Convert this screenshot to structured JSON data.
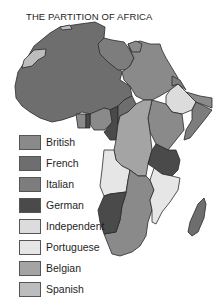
{
  "title": "THE PARTITION OF AFRICA",
  "legend": {
    "items": [
      {
        "label": "British",
        "color": "#8a8a8a"
      },
      {
        "label": "French",
        "color": "#6e6e6e"
      },
      {
        "label": "Italian",
        "color": "#7d7d7d"
      },
      {
        "label": "German",
        "color": "#4a4a4a"
      },
      {
        "label": "Independent",
        "color": "#dcdcdc"
      },
      {
        "label": "Portuguese",
        "color": "#e6e6e6"
      },
      {
        "label": "Belgian",
        "color": "#a4a4a4"
      },
      {
        "label": "Spanish",
        "color": "#bdbdbd"
      }
    ]
  },
  "map_regions": [
    {
      "name": "French North & West Africa",
      "colonial_power": "French"
    },
    {
      "name": "Libya",
      "colonial_power": "Italian"
    },
    {
      "name": "Egypt / Anglo-Egyptian Sudan",
      "colonial_power": "British"
    },
    {
      "name": "Ethiopia",
      "colonial_power": "Independent"
    },
    {
      "name": "Italian Somaliland",
      "colonial_power": "Italian"
    },
    {
      "name": "Belgian Congo",
      "colonial_power": "Belgian"
    },
    {
      "name": "German East Africa",
      "colonial_power": "German"
    },
    {
      "name": "Angola",
      "colonial_power": "Portuguese"
    },
    {
      "name": "German South West Africa",
      "colonial_power": "German"
    },
    {
      "name": "South Africa / Rhodesia",
      "colonial_power": "British"
    },
    {
      "name": "Mozambique",
      "colonial_power": "Portuguese"
    },
    {
      "name": "Madagascar",
      "colonial_power": "French"
    },
    {
      "name": "Rio de Oro",
      "colonial_power": "Spanish"
    }
  ]
}
